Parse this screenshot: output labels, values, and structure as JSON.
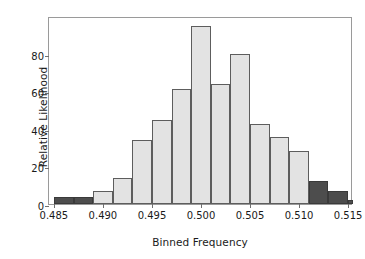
{
  "chart_data": {
    "type": "bar",
    "title": "",
    "subtitle": "",
    "xlabel": "Binned Frequency",
    "ylabel": "Relative Likelihood",
    "xlim": [
      0.4845,
      0.5155
    ],
    "ylim": [
      0,
      100
    ],
    "xticks": [
      0.485,
      0.49,
      0.495,
      0.5,
      0.505,
      0.51,
      0.515
    ],
    "xtick_labels": [
      "0.485",
      "0.490",
      "0.495",
      "0.500",
      "0.505",
      "0.510",
      "0.515"
    ],
    "yticks": [
      0,
      20,
      40,
      60,
      80
    ],
    "ytick_labels": [
      "0",
      "20",
      "40",
      "60",
      "80"
    ],
    "grid": false,
    "legend": "none",
    "bin_width": 0.002,
    "categories": [
      "0.485",
      "0.487",
      "0.489",
      "0.491",
      "0.493",
      "0.495",
      "0.497",
      "0.499",
      "0.501",
      "0.503",
      "0.505",
      "0.507",
      "0.509",
      "0.511",
      "0.513"
    ],
    "values": [
      3.5,
      3.5,
      7,
      14,
      34,
      44.5,
      61,
      94.5,
      64,
      80,
      42.5,
      35.5,
      28,
      12,
      7
    ],
    "bars": [
      {
        "x0": 0.485,
        "x1": 0.487,
        "value": 3.5,
        "color": "#4d4d4d",
        "shade": "dark"
      },
      {
        "x0": 0.487,
        "x1": 0.489,
        "value": 3.5,
        "color": "#4d4d4d",
        "shade": "dark"
      },
      {
        "x0": 0.489,
        "x1": 0.491,
        "value": 7,
        "color": "#e3e3e3",
        "shade": "light"
      },
      {
        "x0": 0.491,
        "x1": 0.493,
        "value": 14,
        "color": "#e3e3e3",
        "shade": "light"
      },
      {
        "x0": 0.493,
        "x1": 0.495,
        "value": 34,
        "color": "#e3e3e3",
        "shade": "light"
      },
      {
        "x0": 0.495,
        "x1": 0.497,
        "value": 44.5,
        "color": "#e3e3e3",
        "shade": "light"
      },
      {
        "x0": 0.497,
        "x1": 0.499,
        "value": 61,
        "color": "#e3e3e3",
        "shade": "light"
      },
      {
        "x0": 0.499,
        "x1": 0.501,
        "value": 94.5,
        "color": "#e3e3e3",
        "shade": "light"
      },
      {
        "x0": 0.501,
        "x1": 0.503,
        "value": 64,
        "color": "#e3e3e3",
        "shade": "light"
      },
      {
        "x0": 0.503,
        "x1": 0.505,
        "value": 80,
        "color": "#e3e3e3",
        "shade": "light"
      },
      {
        "x0": 0.505,
        "x1": 0.507,
        "value": 42.5,
        "color": "#e3e3e3",
        "shade": "light"
      },
      {
        "x0": 0.507,
        "x1": 0.509,
        "value": 35.5,
        "color": "#e3e3e3",
        "shade": "light"
      },
      {
        "x0": 0.509,
        "x1": 0.511,
        "value": 28,
        "color": "#e3e3e3",
        "shade": "light"
      },
      {
        "x0": 0.511,
        "x1": 0.513,
        "value": 12,
        "color": "#4d4d4d",
        "shade": "dark"
      },
      {
        "x0": 0.513,
        "x1": 0.515,
        "value": 7,
        "color": "#4d4d4d",
        "shade": "dark"
      },
      {
        "x0": 0.515,
        "x1": 0.5155,
        "value": 2,
        "color": "#4d4d4d",
        "shade": "dark"
      }
    ],
    "colors": {
      "bar_light_fill": "#e3e3e3",
      "bar_dark_fill": "#4d4d4d",
      "bar_edge": "#5d5d5d",
      "axis": "#9a9a9a",
      "text": "#1a1a1a",
      "background": "#ffffff"
    }
  }
}
